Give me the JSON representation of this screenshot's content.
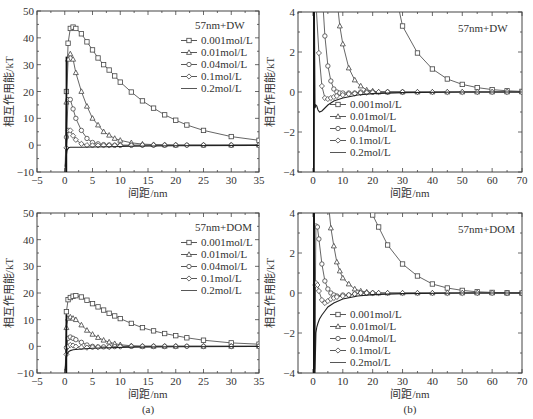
{
  "chart_data": [
    {
      "id": "a-top",
      "type": "line",
      "title": "57nm+DW",
      "xlabel": "间距/nm",
      "ylabel": "相互作用能/kT",
      "xlim": [
        -5,
        35
      ],
      "ylim": [
        -10,
        50
      ],
      "xticks": [
        -5,
        0,
        5,
        10,
        15,
        20,
        25,
        30,
        35
      ],
      "yticks": [
        -10,
        0,
        10,
        20,
        30,
        40,
        50
      ],
      "legend_position": "upper right",
      "box": {
        "x0": 37,
        "y0": 11,
        "x1": 259,
        "y1": 172
      },
      "series": [
        {
          "name": "0.001mol/L",
          "marker": "square",
          "x": [
            0.1,
            0.3,
            0.6,
            1,
            1.5,
            2,
            3,
            4,
            5,
            6,
            7,
            8,
            9,
            10,
            12,
            14,
            16,
            18,
            20,
            22,
            25,
            30,
            35
          ],
          "y": [
            -8,
            20,
            38,
            43.5,
            44,
            43.5,
            41.5,
            38.5,
            35.5,
            32.5,
            30,
            28,
            25.8,
            23.5,
            19.8,
            16.5,
            13.8,
            11.3,
            9.3,
            7.5,
            5.5,
            3.2,
            1.8
          ]
        },
        {
          "name": "0.01mol/L",
          "marker": "triangle",
          "x": [
            0.1,
            0.3,
            0.6,
            1,
            1.5,
            2,
            3,
            4,
            5,
            6,
            7,
            8,
            9,
            10,
            12,
            14,
            16,
            18,
            20,
            25,
            30,
            35
          ],
          "y": [
            -8,
            16,
            32,
            34,
            32,
            27,
            20,
            14.5,
            10,
            7.5,
            5,
            3.7,
            2.5,
            1.8,
            0.9,
            0.4,
            0.2,
            0.1,
            0,
            0,
            0,
            0
          ]
        },
        {
          "name": "0.04mol/L",
          "marker": "circle",
          "x": [
            0.1,
            0.3,
            0.6,
            1,
            1.5,
            2,
            3,
            4,
            5,
            6,
            7,
            8,
            9,
            10,
            12,
            14,
            16,
            18,
            20,
            22,
            25,
            30,
            35
          ],
          "y": [
            -8,
            3,
            17,
            17,
            13.5,
            10,
            5.5,
            2.5,
            1,
            0.5,
            0.2,
            0.1,
            0,
            0,
            0,
            0,
            0,
            0,
            0,
            0,
            0,
            0,
            0
          ]
        },
        {
          "name": "0.1mol/L",
          "marker": "diamond",
          "x": [
            0.1,
            0.3,
            0.6,
            1,
            1.5,
            2,
            3,
            4,
            5,
            6,
            7,
            8,
            9,
            10,
            12,
            14,
            16,
            18,
            20,
            22,
            25,
            30,
            35
          ],
          "y": [
            -8,
            -1,
            5.5,
            5.5,
            3.5,
            2,
            0.5,
            0,
            -0.1,
            -0.1,
            -0.1,
            -0.1,
            -0.1,
            -0.1,
            -0.1,
            0,
            0,
            0,
            0,
            0,
            0,
            0,
            0
          ]
        },
        {
          "name": "0.2mol/L",
          "marker": "none",
          "x": [
            0.05,
            0.2,
            0.4,
            0.7,
            1,
            1.5,
            2,
            3,
            5,
            8,
            12,
            20,
            35
          ],
          "y": [
            -10,
            -5,
            -2,
            -1,
            -0.8,
            -0.8,
            -0.8,
            -0.8,
            -0.7,
            -0.6,
            -0.4,
            -0.2,
            -0.1
          ]
        }
      ]
    },
    {
      "id": "b-top",
      "type": "line",
      "title": "57nm+DW",
      "xlabel": "间距/nm",
      "ylabel": "相互作用能/kT",
      "xlim": [
        -5,
        70
      ],
      "ylim": [
        -4,
        4
      ],
      "xticks": [
        0,
        10,
        20,
        30,
        40,
        50,
        60,
        70
      ],
      "yticks": [
        -4,
        -2,
        0,
        2,
        4
      ],
      "legend_position": "lower center",
      "box": {
        "x0": 298,
        "y0": 12,
        "x1": 522,
        "y1": 172
      },
      "series": [
        {
          "name": "0.001mol/L",
          "marker": "square",
          "x": [
            29,
            30,
            35,
            40,
            45,
            50,
            55,
            60,
            65,
            70
          ],
          "y": [
            4,
            3.3,
            1.95,
            1.15,
            0.65,
            0.38,
            0.22,
            0.12,
            0.06,
            0.03
          ]
        },
        {
          "name": "0.01mol/L",
          "marker": "triangle",
          "x": [
            8.5,
            9,
            10,
            12,
            14,
            16,
            18,
            20,
            22,
            25,
            30,
            35,
            40,
            45,
            50,
            55,
            60,
            65,
            70
          ],
          "y": [
            4,
            3.3,
            2.4,
            1.2,
            0.6,
            0.3,
            0.1,
            0.05,
            0,
            0,
            0,
            0,
            0,
            0,
            0,
            0,
            0,
            0,
            0
          ]
        },
        {
          "name": "0.04mol/L",
          "marker": "circle",
          "x": [
            3.5,
            4,
            5,
            6,
            7,
            8,
            9,
            10,
            12,
            14,
            16,
            18,
            20,
            25,
            30
          ],
          "y": [
            4,
            2.8,
            1.3,
            0.55,
            0.15,
            0,
            -0.05,
            -0.05,
            -0.05,
            -0.05,
            0,
            0,
            0,
            0,
            0
          ]
        },
        {
          "name": "0.1mol/L",
          "marker": "diamond",
          "x": [
            1.2,
            2,
            3,
            4,
            5,
            6,
            7,
            8,
            10,
            12,
            14,
            16,
            18,
            20,
            22,
            25,
            30,
            35,
            40,
            45,
            50,
            55,
            60,
            65,
            70
          ],
          "y": [
            4,
            1.95,
            0.3,
            -0.3,
            -0.35,
            -0.3,
            -0.25,
            -0.2,
            -0.15,
            -0.1,
            -0.08,
            -0.05,
            -0.03,
            -0.02,
            0,
            0,
            0,
            0,
            0,
            0,
            0,
            0,
            0,
            0,
            0
          ]
        },
        {
          "name": "0.2mol/L",
          "marker": "none",
          "x": [
            0.3,
            0.5,
            0.7,
            1,
            1.3,
            1.7,
            2.2,
            3,
            4,
            5,
            7,
            10,
            15,
            20,
            30,
            50,
            70
          ],
          "y": [
            -4,
            4,
            -0.8,
            -0.65,
            -0.7,
            -0.9,
            -1.0,
            -0.95,
            -0.8,
            -0.65,
            -0.45,
            -0.3,
            -0.15,
            -0.08,
            -0.03,
            0,
            0
          ]
        }
      ]
    },
    {
      "id": "a-bottom",
      "type": "line",
      "title": "57nm+DOM",
      "xlabel": "间距/nm",
      "ylabel": "相互作用能/kT",
      "xlim": [
        -5,
        35
      ],
      "ylim": [
        -10,
        50
      ],
      "xticks": [
        -5,
        0,
        5,
        10,
        15,
        20,
        25,
        30,
        35
      ],
      "yticks": [
        -10,
        0,
        10,
        20,
        30,
        40,
        50
      ],
      "legend_position": "upper right",
      "box": {
        "x0": 37,
        "y0": 213,
        "x1": 259,
        "y1": 373
      },
      "series": [
        {
          "name": "0.001mol/L",
          "marker": "square",
          "x": [
            0.1,
            0.3,
            0.6,
            1,
            1.5,
            2,
            3,
            4,
            5,
            6,
            7,
            8,
            9,
            10,
            12,
            14,
            16,
            18,
            20,
            22,
            25,
            30,
            35
          ],
          "y": [
            -9,
            13,
            17.5,
            18.3,
            18.8,
            19,
            18.5,
            17.3,
            16,
            14.8,
            13.6,
            12.4,
            11.4,
            10.4,
            8.6,
            7,
            5.8,
            4.8,
            4,
            3.2,
            2.3,
            1.3,
            0.8
          ]
        },
        {
          "name": "0.01mol/L",
          "marker": "triangle",
          "x": [
            0.1,
            0.3,
            0.6,
            1,
            1.5,
            2,
            3,
            4,
            5,
            6,
            7,
            8,
            9,
            10,
            12,
            14,
            16,
            18,
            20,
            25,
            30,
            35
          ],
          "y": [
            -9,
            7,
            10.5,
            11,
            10.5,
            10,
            8,
            6,
            4.5,
            3.3,
            2.3,
            1.6,
            1,
            0.6,
            0.2,
            0,
            0,
            0,
            0,
            0,
            0,
            0
          ]
        },
        {
          "name": "0.04mol/L",
          "marker": "circle",
          "x": [
            0.1,
            0.3,
            0.6,
            1,
            1.5,
            2,
            3,
            4,
            5,
            6,
            7,
            8,
            9,
            10,
            12,
            14,
            16,
            18,
            20,
            22,
            25,
            30,
            35
          ],
          "y": [
            -9,
            -0.5,
            3,
            3.5,
            3,
            2.5,
            1.5,
            0.5,
            0,
            -0.2,
            -0.2,
            -0.2,
            -0.1,
            0,
            0,
            0,
            0,
            0,
            0,
            0,
            0,
            0,
            0
          ]
        },
        {
          "name": "0.1mol/L",
          "marker": "diamond",
          "x": [
            0.1,
            0.3,
            0.6,
            1,
            1.5,
            2,
            3,
            4,
            5,
            6,
            8,
            10,
            12,
            14,
            16,
            18,
            20,
            22,
            25,
            30,
            35
          ],
          "y": [
            -9,
            -3,
            0,
            0.5,
            0.3,
            -0.1,
            -0.4,
            -0.5,
            -0.4,
            -0.3,
            -0.2,
            -0.1,
            0,
            0,
            0,
            0,
            0,
            0,
            0,
            0,
            0
          ]
        },
        {
          "name": "0.2mol/L",
          "marker": "none",
          "x": [
            0.05,
            0.2,
            0.4,
            0.7,
            1,
            1.5,
            2,
            3,
            5,
            8,
            12,
            20,
            35
          ],
          "y": [
            -10,
            -5,
            -3,
            -2,
            -1.6,
            -1.3,
            -1.2,
            -1,
            -0.7,
            -0.5,
            -0.3,
            -0.15,
            -0.05
          ]
        }
      ]
    },
    {
      "id": "b-bottom",
      "type": "line",
      "title": "57nm+DOM",
      "xlabel": "间距/nm",
      "ylabel": "相互作用能/kT",
      "xlim": [
        -5,
        70
      ],
      "ylim": [
        -4,
        4
      ],
      "xticks": [
        0,
        10,
        20,
        30,
        40,
        50,
        60,
        70
      ],
      "yticks": [
        -4,
        -2,
        0,
        2,
        4
      ],
      "legend_position": "lower center",
      "box": {
        "x0": 298,
        "y0": 213,
        "x1": 522,
        "y1": 373
      },
      "series": [
        {
          "name": "0.001mol/L",
          "marker": "square",
          "x": [
            19,
            20,
            22,
            25,
            30,
            35,
            40,
            45,
            50,
            55,
            60,
            65,
            70
          ],
          "y": [
            4,
            3.9,
            3.3,
            2.4,
            1.45,
            0.85,
            0.45,
            0.25,
            0.13,
            0.06,
            0.03,
            0.01,
            0
          ]
        },
        {
          "name": "0.01mol/L",
          "marker": "triangle",
          "x": [
            5.5,
            6,
            7,
            8,
            9,
            10,
            12,
            14,
            16,
            18,
            20,
            22,
            25,
            30,
            35,
            40,
            45,
            50,
            55,
            60,
            65,
            70
          ],
          "y": [
            4,
            3.25,
            2.35,
            1.55,
            1.1,
            0.75,
            0.45,
            0.2,
            0.1,
            0.05,
            0,
            0,
            0,
            0,
            0,
            0,
            0,
            0,
            0,
            0,
            0,
            0
          ]
        },
        {
          "name": "0.04mol/L",
          "marker": "circle",
          "x": [
            0.6,
            1,
            1.5,
            2,
            3,
            4,
            5,
            6,
            7,
            8,
            10,
            12,
            14,
            16,
            18,
            20
          ],
          "y": [
            -3.8,
            3.35,
            3.3,
            2.7,
            1.45,
            0.6,
            0.2,
            0,
            -0.1,
            -0.15,
            -0.1,
            -0.1,
            -0.05,
            0,
            0,
            0
          ]
        },
        {
          "name": "0.1mol/L",
          "marker": "diamond",
          "x": [
            0.5,
            0.8,
            1,
            1.5,
            2,
            3,
            4,
            5,
            6,
            7,
            8,
            10,
            12,
            14,
            16,
            18,
            20,
            22,
            25,
            30,
            35,
            40,
            45,
            50,
            55,
            60,
            65,
            70
          ],
          "y": [
            -2.7,
            0.4,
            0.5,
            0.4,
            0.1,
            -0.35,
            -0.5,
            -0.4,
            -0.3,
            -0.25,
            -0.2,
            -0.15,
            -0.1,
            -0.05,
            0,
            0,
            0,
            0,
            0,
            0,
            0,
            0,
            0,
            0,
            0,
            0,
            0,
            0
          ]
        },
        {
          "name": "0.2mol/L",
          "marker": "none",
          "x": [
            0.3,
            0.5,
            0.7,
            1,
            1.3,
            1.7,
            2.2,
            3,
            4,
            5,
            7,
            10,
            15,
            20,
            30,
            50,
            70
          ],
          "y": [
            -4,
            4,
            -4,
            -2,
            -1.7,
            -1.5,
            -1.3,
            -1.1,
            -0.9,
            -0.7,
            -0.5,
            -0.3,
            -0.15,
            -0.08,
            -0.03,
            0,
            0
          ]
        }
      ]
    }
  ],
  "captions": {
    "left": "(a)",
    "right": "(b)"
  }
}
